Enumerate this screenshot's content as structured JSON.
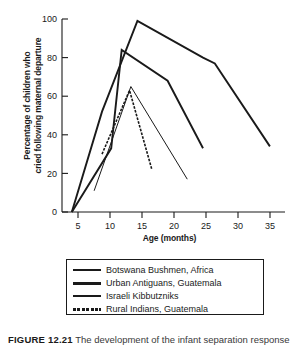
{
  "chart_data": {
    "type": "line",
    "title": "",
    "xlabel": "Age (months)",
    "ylabel": "Percentage of children who cried following maternal departure",
    "ylabel_line1": "Percentage of children who",
    "ylabel_line2": "cried following maternal departure",
    "xlim": [
      3.5,
      37.5
    ],
    "ylim": [
      0,
      100
    ],
    "xticks": [
      5,
      10,
      15,
      20,
      25,
      30,
      35
    ],
    "yticks": [
      0,
      20,
      40,
      60,
      80,
      100
    ],
    "grid": false,
    "legend_position": "below-plot",
    "series": [
      {
        "name": "Botswana Bushmen, Africa",
        "style": "solid-thick",
        "color": "#1a1a1a",
        "points": [
          {
            "x": 5.0,
            "y": 0
          },
          {
            "x": 9.6,
            "y": 52
          },
          {
            "x": 15.0,
            "y": 99
          },
          {
            "x": 25.0,
            "y": 80
          },
          {
            "x": 26.8,
            "y": 77
          },
          {
            "x": 35.2,
            "y": 34
          }
        ]
      },
      {
        "name": "Urban Antiguans, Guatemala",
        "style": "solid-thick",
        "color": "#1a1a1a",
        "points": [
          {
            "x": 5.0,
            "y": 0
          },
          {
            "x": 11.0,
            "y": 33
          },
          {
            "x": 12.6,
            "y": 84
          },
          {
            "x": 19.6,
            "y": 68
          },
          {
            "x": 25.0,
            "y": 33
          }
        ]
      },
      {
        "name": "Israeli Kibbutzniks",
        "style": "solid-thin",
        "color": "#1a1a1a",
        "points": [
          {
            "x": 8.4,
            "y": 11
          },
          {
            "x": 14.0,
            "y": 65
          },
          {
            "x": 22.6,
            "y": 17
          }
        ]
      },
      {
        "name": "Rural Indians, Guatemala",
        "style": "dashed",
        "color": "#1a1a1a",
        "points": [
          {
            "x": 9.6,
            "y": 30
          },
          {
            "x": 13.8,
            "y": 63
          },
          {
            "x": 17.2,
            "y": 22
          }
        ]
      }
    ]
  },
  "legend": {
    "items": [
      {
        "label": "Botswana Bushmen, Africa",
        "swatch": "thick"
      },
      {
        "label": "Urban Antiguans, Guatemala",
        "swatch": "xthick"
      },
      {
        "label": "Israeli Kibbutzniks",
        "swatch": "thin"
      },
      {
        "label": "Rural Indians, Guatemala",
        "swatch": "dash"
      }
    ]
  },
  "caption": {
    "number": "FIGURE 12.21",
    "text": "The development of the infant separation response"
  }
}
